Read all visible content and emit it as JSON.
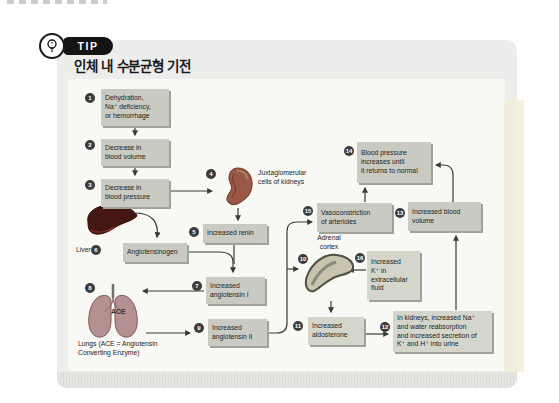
{
  "tip": {
    "label": "TIP"
  },
  "title": "인체 내 수분균형 기전",
  "nodes": {
    "n1": {
      "num": "1",
      "text": "Dehydration,\nNa⁺ deficiency,\nor hemorrhage"
    },
    "n2": {
      "num": "2",
      "text": "Decrease in\nblood volume"
    },
    "n3": {
      "num": "3",
      "text": "Decrease in\nblood pressure"
    },
    "n4": {
      "num": "4",
      "label": "Juxtaglomerular\ncells of kidneys"
    },
    "n5": {
      "num": "5",
      "text": "Increased renin"
    },
    "n6": {
      "num": "6",
      "organ": "Liver",
      "text": "Angiotensinogen"
    },
    "n7": {
      "num": "7",
      "text": "Increased\nangiotensin I"
    },
    "n8": {
      "num": "8",
      "ace": "ACE",
      "caption": "Lungs (ACE = Angiotensin\nConverting Enzyme)"
    },
    "n9": {
      "num": "9",
      "text": "Increased\nangiotensin II"
    },
    "n10": {
      "num": "10",
      "label": "Adrenal\ncortex"
    },
    "n11": {
      "num": "11",
      "text": "Increased\naldosterone"
    },
    "n12": {
      "num": "12",
      "text": "In kidneys, increased Na⁺\nand water reabsorption\nand increased secretion of\nK⁺ and H⁺ into urine"
    },
    "n13": {
      "num": "13",
      "text": "Increased blood\nvolume"
    },
    "n14": {
      "num": "14",
      "text": "Blood pressure\nincreases until\nit returns to normal"
    },
    "n15": {
      "num": "15",
      "text": "Vasoconstriction\nof arterioles"
    },
    "n16": {
      "num": "16",
      "text": "Increased\nK⁺ in\nextracellular\nfluid"
    }
  },
  "colors": {
    "panel_bg": "#ededeb",
    "diagram_bg": "#f8f8f4",
    "box_fill": "#c9cbc2",
    "box_shadow": "#a0a298",
    "step_circle": "#3c3c3c",
    "badge_black": "#141414",
    "kidney": "#9a5847",
    "liver": "#441713",
    "lungs": "#b49090",
    "adrenal": "#c9c4ad"
  }
}
